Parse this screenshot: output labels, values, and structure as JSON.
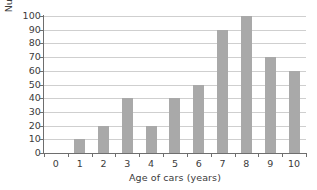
{
  "chart_data": {
    "type": "bar",
    "title": "",
    "subtitle": "",
    "xlabel": "Age of cars (years)",
    "ylabel": "Number of cars",
    "categories": [
      "0",
      "1",
      "2",
      "3",
      "4",
      "5",
      "6",
      "7",
      "8",
      "9",
      "10"
    ],
    "values": [
      0,
      10,
      20,
      40,
      20,
      40,
      50,
      90,
      100,
      70,
      60
    ],
    "ylim": [
      0,
      100
    ],
    "ytick_labels": [
      "0",
      "10",
      "20",
      "30",
      "40",
      "50",
      "60",
      "70",
      "80",
      "90",
      "100"
    ],
    "ytick_values": [
      0,
      10,
      20,
      30,
      40,
      50,
      60,
      70,
      80,
      90,
      100
    ],
    "ytick_step": 10,
    "grid": "horizontal",
    "legend": "none",
    "annotations": [],
    "colors": {
      "bar_fill": "#a9a9a9",
      "gridline": "#cfcfcf",
      "axis_line": "#6e6e6e",
      "text": "#3b3b3b",
      "background": "#ffffff"
    }
  }
}
